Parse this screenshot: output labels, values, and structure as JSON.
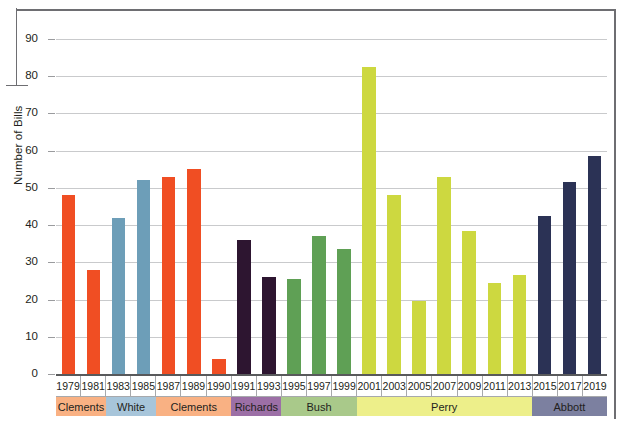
{
  "chart_data": {
    "type": "bar",
    "title": "",
    "xlabel": "",
    "ylabel": "Number of Bills",
    "ylim": [
      0,
      90
    ],
    "ytick_labels": [
      "0",
      "10",
      "20",
      "30",
      "40",
      "50",
      "60",
      "70",
      "80",
      "90"
    ],
    "yticks": [
      0,
      10,
      20,
      30,
      40,
      50,
      60,
      70,
      80,
      90
    ],
    "grid": true,
    "legend_position": "none",
    "categories": [
      "1979",
      "1981",
      "1983",
      "1985",
      "1987",
      "1989",
      "1990",
      "1991",
      "1993",
      "1995",
      "1997",
      "1999",
      "2001",
      "2003",
      "2005",
      "2007",
      "2009",
      "2011",
      "2013",
      "2015",
      "2017",
      "2019"
    ],
    "values": [
      48,
      28,
      42,
      52,
      53,
      55,
      4,
      36,
      26,
      25.5,
      37,
      33.5,
      82.5,
      48,
      19.5,
      53,
      38.5,
      24.5,
      26.5,
      42.5,
      51.5,
      58.5
    ],
    "bar_colors": [
      "#F04E23",
      "#F04E23",
      "#6D9EB8",
      "#6D9EB8",
      "#F04E23",
      "#F04E23",
      "#F04E23",
      "#2D1530",
      "#2D1530",
      "#5FA055",
      "#5FA055",
      "#5FA055",
      "#CDD840",
      "#CDD840",
      "#CDD840",
      "#CDD840",
      "#CDD840",
      "#CDD840",
      "#CDD840",
      "#2B3255",
      "#2B3255",
      "#2B3255"
    ],
    "groups": [
      {
        "label": "Clements",
        "span": 2,
        "band_color": "#F9B183",
        "bar_color": "#F04E23"
      },
      {
        "label": "White",
        "span": 2,
        "band_color": "#A7C5DA",
        "bar_color": "#6D9EB8"
      },
      {
        "label": "Clements",
        "span": 3,
        "band_color": "#F9B183",
        "bar_color": "#F04E23"
      },
      {
        "label": "Richards",
        "span": 2,
        "band_color": "#9C6FA6",
        "bar_color": "#2D1530"
      },
      {
        "label": "Bush",
        "span": 3,
        "band_color": "#A9C98A",
        "bar_color": "#5FA055"
      },
      {
        "label": "Perry",
        "span": 7,
        "band_color": "#EDEF8A",
        "bar_color": "#CDD840"
      },
      {
        "label": "Abbott",
        "span": 3,
        "band_color": "#7C80A0",
        "bar_color": "#2B3255"
      }
    ]
  },
  "colors": {
    "orange": "#F04E23",
    "blue": "#6D9EB8",
    "purple": "#2D1530",
    "green": "#5FA055",
    "yellowgreen": "#CDD840",
    "navy": "#2B3255",
    "gridline": "#c9cacc",
    "axis": "#58595b",
    "frame": "#6e6e72"
  }
}
